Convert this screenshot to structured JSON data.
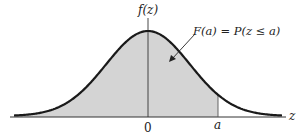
{
  "figure": {
    "y_axis_label": "f(z)",
    "x_axis_label": "z",
    "annotation": "F(a) = P(z ≤ a)",
    "ticks": {
      "zero": "0",
      "a": "a"
    },
    "colors": {
      "curve": "#1a1a1a",
      "shade": "#d4d4d4",
      "axis": "#333333",
      "background": "#ffffff"
    }
  },
  "chart_data": {
    "type": "area",
    "title": "",
    "xlabel": "z",
    "ylabel": "f(z)",
    "shaded_region": "z ≤ a",
    "annotation": "F(a) = P(z ≤ a)",
    "x_ticks": [
      "0",
      "a"
    ],
    "grid": false,
    "legend": "none"
  }
}
